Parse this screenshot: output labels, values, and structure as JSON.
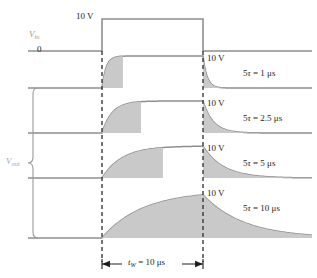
{
  "figure": {
    "type": "waveform-diagram",
    "colors": {
      "trace": "#8f8f8f",
      "fill": "#c9c9c9",
      "dashed": "#3a3a3a",
      "text": "#1e1e1e",
      "faint_label": "#a0a0a0"
    }
  },
  "input": {
    "signal_label": "V",
    "signal_sub": "in",
    "amplitude_label": "10 V",
    "baseline_label": "0",
    "high_value": 10,
    "low_value": 0,
    "units": "V"
  },
  "output": {
    "group_label": "V",
    "group_sub": "out",
    "traces": [
      {
        "id": "tau1",
        "amplitude_label": "10 V",
        "tau_label": "5τ = 1 μs",
        "five_tau_us": 1,
        "tau_us": 0.2,
        "reaches_full": true
      },
      {
        "id": "tau2.5",
        "amplitude_label": "10 V",
        "tau_label": "5τ = 2.5 μs",
        "five_tau_us": 2.5,
        "tau_us": 0.5,
        "reaches_full": true
      },
      {
        "id": "tau5",
        "amplitude_label": "10 V",
        "tau_label": "5τ = 5 μs",
        "five_tau_us": 5,
        "tau_us": 1.0,
        "reaches_full": true
      },
      {
        "id": "tau10",
        "amplitude_label": "10 V",
        "tau_label": "5τ = 10 μs",
        "five_tau_us": 10,
        "tau_us": 2.0,
        "reaches_full": false
      }
    ]
  },
  "pulse_width": {
    "label_var": "t",
    "label_sub": "W",
    "label_rest": " = 10 μs",
    "value_us": 10
  },
  "chart_data": {
    "type": "line",
    "title": "",
    "xlabel": "",
    "ylabel": "",
    "x_units": "μs",
    "y_units": "V",
    "pulse_width_us": 10,
    "pulse_amplitude_v": 10,
    "series": [
      {
        "name": "Vin",
        "kind": "square-pulse",
        "start_us": 0,
        "end_us": 10,
        "high": 10,
        "low": 0
      },
      {
        "name": "Vout 5τ = 1 μs",
        "kind": "rc-response",
        "tau_us": 0.2,
        "peak_v": 10.0
      },
      {
        "name": "Vout 5τ = 2.5 μs",
        "kind": "rc-response",
        "tau_us": 0.5,
        "peak_v": 10.0
      },
      {
        "name": "Vout 5τ = 5 μs",
        "kind": "rc-response",
        "tau_us": 1.0,
        "peak_v": 10.0
      },
      {
        "name": "Vout 5τ = 10 μs",
        "kind": "rc-response",
        "tau_us": 2.0,
        "peak_v": 9.9
      }
    ]
  }
}
